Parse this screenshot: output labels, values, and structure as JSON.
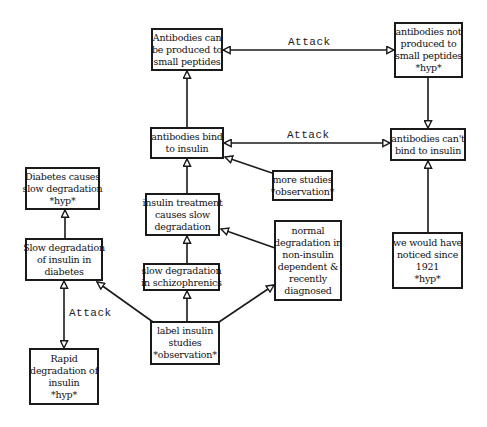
{
  "diagram": {
    "type": "argument-graph",
    "colors": {
      "line": "#1a1a1a",
      "text": "#111111",
      "background": "#ffffff"
    },
    "nodes": [
      {
        "id": "n1",
        "lines": [
          "Antibodies can",
          "be produced to",
          "small peptides"
        ]
      },
      {
        "id": "n2",
        "lines": [
          "antibodies not",
          "produced to",
          "small peptides",
          "*hyp*"
        ]
      },
      {
        "id": "n3",
        "lines": [
          "antibodies bind",
          "to insulin"
        ]
      },
      {
        "id": "n4",
        "lines": [
          "antibodies can't",
          "bind to insulin"
        ]
      },
      {
        "id": "n5",
        "lines": [
          "more studies",
          "*observation*"
        ]
      },
      {
        "id": "n6",
        "lines": [
          "Diabetes causes",
          "slow degradation",
          "*hyp*"
        ]
      },
      {
        "id": "n7",
        "lines": [
          "insulin treatment",
          "causes slow",
          "degradation"
        ]
      },
      {
        "id": "n8",
        "lines": [
          "normal",
          "degradation in",
          "non-insulin",
          "dependent &",
          "recently",
          "diagnosed"
        ]
      },
      {
        "id": "n9",
        "lines": [
          "we would have",
          "noticed since",
          "1921",
          "*hyp*"
        ]
      },
      {
        "id": "n10",
        "lines": [
          "Slow degradation",
          "of insulin in",
          "diabetes"
        ]
      },
      {
        "id": "n11",
        "lines": [
          "slow degradation",
          "in schizophrenics"
        ]
      },
      {
        "id": "n12",
        "lines": [
          "label insulin",
          "studies",
          "*observation*"
        ]
      },
      {
        "id": "n13",
        "lines": [
          "Rapid",
          "degradation of",
          "insulin",
          "*hyp*"
        ]
      }
    ],
    "edges": [
      {
        "from": "n3",
        "to": "n1",
        "kind": "support"
      },
      {
        "from": "n1",
        "to": "n2",
        "kind": "attack",
        "label": "Attack"
      },
      {
        "from": "n2",
        "to": "n4",
        "kind": "support"
      },
      {
        "from": "n3",
        "to": "n4",
        "kind": "attack",
        "label": "Attack"
      },
      {
        "from": "n5",
        "to": "n3",
        "kind": "support"
      },
      {
        "from": "n7",
        "to": "n3",
        "kind": "support"
      },
      {
        "from": "n9",
        "to": "n4",
        "kind": "support"
      },
      {
        "from": "n10",
        "to": "n6",
        "kind": "support"
      },
      {
        "from": "n8",
        "to": "n7",
        "kind": "support"
      },
      {
        "from": "n11",
        "to": "n7",
        "kind": "support"
      },
      {
        "from": "n12",
        "to": "n11",
        "kind": "support"
      },
      {
        "from": "n12",
        "to": "n10",
        "kind": "support"
      },
      {
        "from": "n12",
        "to": "n8",
        "kind": "support"
      },
      {
        "from": "n10",
        "to": "n13",
        "kind": "attack",
        "label": "Attack"
      }
    ],
    "edge_labels": {
      "attack_top": "Attack",
      "attack_middle": "Attack",
      "attack_left": "Attack"
    }
  }
}
